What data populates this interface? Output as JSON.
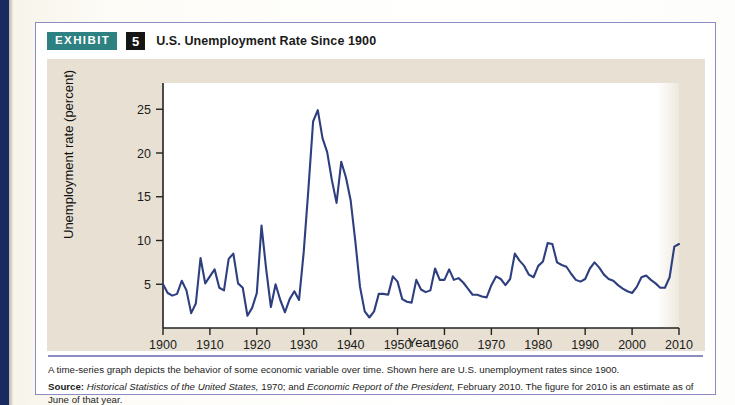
{
  "exhibit": {
    "badge_label": "EXHIBIT",
    "number": "5",
    "title": "U.S. Unemployment Rate Since 1900",
    "badge_color": "#2e8181",
    "number_color": "#151515",
    "border_color": "#8d8cc0",
    "card_background": "#e8e1d3",
    "line_color": "#2e3f7f"
  },
  "footer": {
    "caption": "A time-series graph depicts the behavior of some economic variable over time. Shown here are U.S. unemployment rates since 1900.",
    "source_label": "Source:",
    "source_part1_italic": "Historical Statistics of the United States,",
    "source_mid": " 1970; and ",
    "source_part2_italic": "Economic Report of the President,",
    "source_tail": " February 2010. The figure for 2010 is an estimate as of June of that year."
  },
  "chart_data": {
    "type": "line",
    "title": "U.S. Unemployment Rate Since 1900",
    "xlabel": "Year",
    "ylabel": "Unemployment rate (percent)",
    "xlim": [
      1900,
      2010
    ],
    "ylim": [
      0,
      28
    ],
    "grid": false,
    "legend": "none",
    "xticks": [
      1900,
      1910,
      1920,
      1930,
      1940,
      1950,
      1960,
      1970,
      1980,
      1990,
      2000,
      2010
    ],
    "yticks": [
      5,
      10,
      15,
      20,
      25
    ],
    "series": [
      {
        "name": "Unemployment rate",
        "color": "#2e3f7f",
        "x": [
          1900,
          1901,
          1902,
          1903,
          1904,
          1905,
          1906,
          1907,
          1908,
          1909,
          1910,
          1911,
          1912,
          1913,
          1914,
          1915,
          1916,
          1917,
          1918,
          1919,
          1920,
          1921,
          1922,
          1923,
          1924,
          1925,
          1926,
          1927,
          1928,
          1929,
          1930,
          1931,
          1932,
          1933,
          1934,
          1935,
          1936,
          1937,
          1938,
          1939,
          1940,
          1941,
          1942,
          1943,
          1944,
          1945,
          1946,
          1947,
          1948,
          1949,
          1950,
          1951,
          1952,
          1953,
          1954,
          1955,
          1956,
          1957,
          1958,
          1959,
          1960,
          1961,
          1962,
          1963,
          1964,
          1965,
          1966,
          1967,
          1968,
          1969,
          1970,
          1971,
          1972,
          1973,
          1974,
          1975,
          1976,
          1977,
          1978,
          1979,
          1980,
          1981,
          1982,
          1983,
          1984,
          1985,
          1986,
          1987,
          1988,
          1989,
          1990,
          1991,
          1992,
          1993,
          1994,
          1995,
          1996,
          1997,
          1998,
          1999,
          2000,
          2001,
          2002,
          2003,
          2004,
          2005,
          2006,
          2007,
          2008,
          2009,
          2010
        ],
        "values": [
          5.0,
          4.0,
          3.7,
          3.9,
          5.4,
          4.3,
          1.7,
          2.8,
          8.0,
          5.1,
          5.9,
          6.7,
          4.6,
          4.3,
          7.9,
          8.5,
          5.1,
          4.6,
          1.4,
          2.3,
          4.0,
          11.7,
          6.7,
          2.4,
          5.0,
          3.2,
          1.8,
          3.3,
          4.2,
          3.2,
          8.7,
          15.9,
          23.6,
          24.9,
          21.7,
          20.1,
          16.9,
          14.3,
          19.0,
          17.2,
          14.6,
          9.9,
          4.7,
          1.9,
          1.2,
          1.9,
          3.9,
          3.9,
          3.8,
          5.9,
          5.3,
          3.3,
          3.0,
          2.9,
          5.5,
          4.4,
          4.1,
          4.3,
          6.8,
          5.5,
          5.5,
          6.7,
          5.5,
          5.7,
          5.2,
          4.5,
          3.8,
          3.8,
          3.6,
          3.5,
          4.9,
          5.9,
          5.6,
          4.9,
          5.6,
          8.5,
          7.7,
          7.1,
          6.1,
          5.8,
          7.1,
          7.6,
          9.7,
          9.6,
          7.5,
          7.2,
          7.0,
          6.2,
          5.5,
          5.3,
          5.6,
          6.8,
          7.5,
          6.9,
          6.1,
          5.6,
          5.4,
          4.9,
          4.5,
          4.2,
          4.0,
          4.7,
          5.8,
          6.0,
          5.5,
          5.1,
          4.6,
          4.6,
          5.8,
          9.3,
          9.6
        ]
      }
    ]
  }
}
